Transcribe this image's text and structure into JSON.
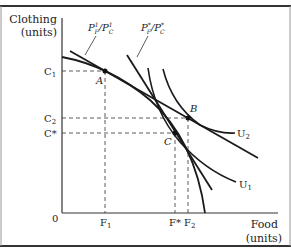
{
  "diagram": {
    "type": "production possibilities frontier with indifference curves",
    "y_axis_label_line1": "Clothing",
    "y_axis_label_line2": "(units)",
    "x_axis_label_line1": "Food",
    "x_axis_label_line2": "(units)",
    "origin_label": "0",
    "y_ticks": {
      "c1": "C",
      "c1_sub": "1",
      "c2": "C",
      "c2_sub": "2",
      "cstar": "C*"
    },
    "x_ticks": {
      "f1": "F",
      "f1_sub": "1",
      "fstar": "F*",
      "f2": "F",
      "f2_sub": "2"
    },
    "points": {
      "a": "A",
      "b": "B",
      "c": "C"
    },
    "price_lines": {
      "p1": {
        "num": "P",
        "num_sup": "1",
        "num_sub": "F",
        "den": "P",
        "den_sup": "1",
        "den_sub": "C"
      },
      "pstar": {
        "num": "P",
        "num_sup": "*",
        "num_sub": "F",
        "den": "P",
        "den_sup": "*",
        "den_sub": "C"
      }
    },
    "curves": {
      "u1": "U",
      "u1_sub": "1",
      "u2": "U",
      "u2_sub": "2"
    },
    "colors": {
      "line": "#1a1a1a",
      "dash": "#333333",
      "frame": "#333333"
    }
  }
}
